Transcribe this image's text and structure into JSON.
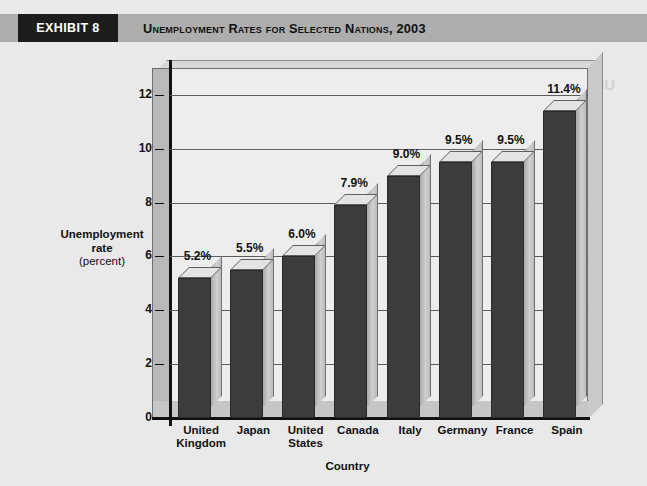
{
  "header": {
    "badge": "EXHIBIT 8",
    "title": "Unemployment Rates for Selected Nations, 2003",
    "badge_bg": "#1d1d1d",
    "band_bg": "#adadad"
  },
  "artifact": {
    "bleed_text": "Unemployment of Greece Rates"
  },
  "chart_data": {
    "type": "bar",
    "title": "Unemployment Rates for Selected Nations, 2003",
    "xlabel": "Country",
    "ylabel": "Unemployment rate (percent)",
    "ylabel_line1": "Unemployment",
    "ylabel_line2": "rate",
    "ylabel_line3": "(percent)",
    "categories": [
      "United\nKingdom",
      "Japan",
      "United\nStates",
      "Canada",
      "Italy",
      "Germany",
      "France",
      "Spain"
    ],
    "values": [
      5.2,
      5.5,
      6.0,
      7.9,
      9.0,
      9.5,
      9.5,
      11.4
    ],
    "data_labels": [
      "5.2%",
      "5.5%",
      "6.0%",
      "7.9%",
      "9.0%",
      "9.5%",
      "9.5%",
      "11.4%"
    ],
    "yticks": [
      0,
      2,
      4,
      6,
      8,
      10,
      12
    ],
    "ytick_labels": [
      "0",
      "2",
      "4",
      "6",
      "8",
      "10",
      "12"
    ],
    "ylim": [
      0,
      13.0
    ],
    "grid": true,
    "legend": false,
    "style": "3d-column",
    "bar_face_color": "#3c3c3c",
    "bar_side_color": "#c0c0c0",
    "bar_top_color": "#e4e4e4",
    "plot_bg": "#ededed"
  }
}
